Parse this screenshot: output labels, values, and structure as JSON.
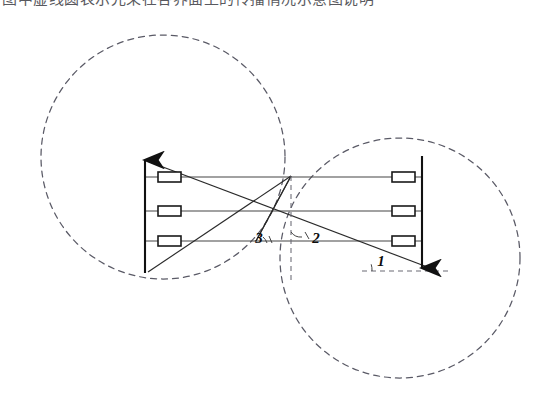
{
  "figure": {
    "kind": "optical-ray-diagram",
    "background_color": "#ffffff",
    "width": 556,
    "height": 416
  },
  "top_clipped_caption": {
    "text": "图中虚线圆表示光束在各界面上的传播情况示意图说明",
    "note": "partially cropped line of text at very top of page"
  },
  "angle_labels": [
    {
      "id": "angle-1",
      "text": "1",
      "x": 381,
      "y": 266
    },
    {
      "id": "angle-2",
      "text": "2",
      "x": 316,
      "y": 243
    },
    {
      "id": "angle-3",
      "text": "3",
      "x": 259,
      "y": 243
    }
  ],
  "axes": {
    "left": {
      "name": "left-vertical-axis",
      "x": 145,
      "y_top": 157,
      "y_bottom": 273,
      "arrow": "up"
    },
    "right": {
      "name": "right-vertical-axis",
      "x": 422,
      "y_top": 156,
      "y_bottom": 271,
      "arrow": "down"
    }
  },
  "horizontal_rays": [
    {
      "y": 177,
      "x_start": 145,
      "x_end": 422
    },
    {
      "y": 211,
      "x_start": 145,
      "x_end": 422
    },
    {
      "y": 241,
      "x_start": 145,
      "x_end": 422
    }
  ],
  "blocks": [
    {
      "side": "left",
      "x": 158,
      "y": 172,
      "w": 23,
      "h": 10
    },
    {
      "side": "left",
      "x": 158,
      "y": 206,
      "w": 23,
      "h": 10
    },
    {
      "side": "left",
      "x": 158,
      "y": 236,
      "w": 23,
      "h": 10
    },
    {
      "side": "right",
      "x": 392,
      "y": 172,
      "w": 23,
      "h": 10
    },
    {
      "side": "right",
      "x": 392,
      "y": 206,
      "w": 23,
      "h": 10
    },
    {
      "side": "right",
      "x": 392,
      "y": 236,
      "w": 23,
      "h": 10
    }
  ],
  "dashed_circles": [
    {
      "id": "left-circle",
      "cx": 163,
      "cy": 157,
      "r": 122
    },
    {
      "id": "right-circle",
      "cx": 400,
      "cy": 258,
      "r": 120
    }
  ],
  "colors": {
    "ink": "#1c1c1c",
    "dashed": "#5a5a66",
    "ray": "#444444",
    "paper": "#ffffff"
  }
}
